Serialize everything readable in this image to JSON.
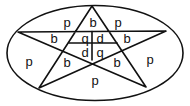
{
  "diagram": {
    "colors": {
      "stroke": "#111111",
      "background": "#ffffff"
    },
    "ellipse": {
      "cx": 95,
      "cy": 53,
      "rx": 88,
      "ry": 47.5
    },
    "star_points": {
      "top": [
        92,
        6
      ],
      "left": [
        18,
        32
      ],
      "right": [
        166,
        31
      ],
      "bottom_left": [
        39,
        88
      ],
      "bottom_right": [
        146,
        87
      ]
    },
    "inner_cross": {
      "vertical": {
        "x": 92,
        "y1": 31.5,
        "y2": 60
      },
      "horizontal": {
        "y": 43,
        "x1": 69,
        "x2": 117
      }
    },
    "labels": [
      {
        "id": "p-top-left",
        "text": "p",
        "x": 67,
        "y": 22
      },
      {
        "id": "b-top",
        "text": "b",
        "x": 93,
        "y": 22
      },
      {
        "id": "p-top-right",
        "text": "p",
        "x": 118,
        "y": 22
      },
      {
        "id": "b-left",
        "text": "b",
        "x": 54,
        "y": 38
      },
      {
        "id": "q-upper",
        "text": "q",
        "x": 85,
        "y": 38
      },
      {
        "id": "d-upper",
        "text": "d",
        "x": 100,
        "y": 38
      },
      {
        "id": "b-right",
        "text": "b",
        "x": 127,
        "y": 38
      },
      {
        "id": "d-lower",
        "text": "d",
        "x": 85,
        "y": 52
      },
      {
        "id": "q-lower",
        "text": "q",
        "x": 100,
        "y": 52
      },
      {
        "id": "p-left",
        "text": "p",
        "x": 29,
        "y": 61
      },
      {
        "id": "b-lower-left",
        "text": "b",
        "x": 67,
        "y": 62
      },
      {
        "id": "b-lower-right",
        "text": "b",
        "x": 117,
        "y": 62
      },
      {
        "id": "p-right",
        "text": "p",
        "x": 150,
        "y": 59
      },
      {
        "id": "p-bottom",
        "text": "p",
        "x": 95,
        "y": 80
      }
    ]
  }
}
